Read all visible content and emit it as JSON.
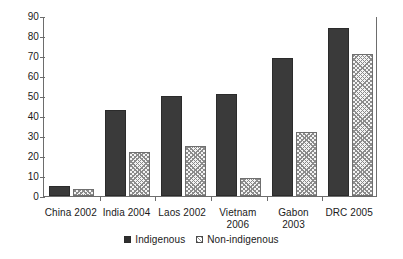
{
  "chart_data": {
    "type": "bar",
    "title": "",
    "subtitle": "",
    "xlabel": "",
    "ylabel": "",
    "ylim": [
      0,
      90
    ],
    "y_ticks": [
      0,
      10,
      20,
      30,
      40,
      50,
      60,
      70,
      80,
      90
    ],
    "grid": false,
    "legend_position": "bottom-center",
    "categories": [
      "China 2002",
      "India 2004",
      "Laos 2002",
      "Vietnam\n2006",
      "Gabon\n2003",
      "DRC 2005"
    ],
    "series": [
      {
        "name": "Indigenous",
        "color": "#3a3a3a",
        "pattern": "solid",
        "values": [
          5,
          43,
          50,
          51,
          69,
          84
        ]
      },
      {
        "name": "Non-indigenous",
        "color": "#f4f4f4",
        "pattern": "cross-hatch",
        "values": [
          3.5,
          22,
          25,
          9,
          32,
          71
        ]
      }
    ]
  },
  "legend": {
    "items": [
      {
        "label": "Indigenous",
        "pattern": "solid"
      },
      {
        "label": "Non-indigenous",
        "pattern": "cross-hatch"
      }
    ]
  },
  "colors": {
    "indigenous": "#3a3a3a",
    "non_indigenous_fill": "#f4f4f4",
    "non_indigenous_hatch": "#8b8b8b",
    "axis": "#6d6d6d",
    "text": "#1a1a1a",
    "background": "#ffffff"
  }
}
